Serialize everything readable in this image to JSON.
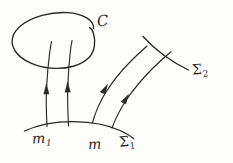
{
  "figure": {
    "kind": "hand-drawn-diagram",
    "background_color": "#fdfdfb",
    "ink_color": "#2a2724",
    "width": 233,
    "height": 163
  },
  "labels": {
    "loop": "C",
    "point_m1_base": "m",
    "point_m1_sub": "1",
    "point_m": "m",
    "surface1_base": "Σ",
    "surface1_sub": "1",
    "surface2_base": "Σ",
    "surface2_sub": "2"
  },
  "elements": {
    "closed_loop_name": "closed curve C",
    "lower_surface_name": "surface Sigma 1",
    "upper_surface_name": "surface Sigma 2",
    "trajectory_count": 4,
    "arrow_direction": "upward along trajectories"
  }
}
